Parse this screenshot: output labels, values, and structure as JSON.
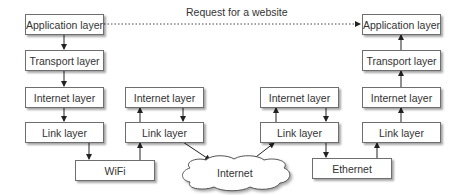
{
  "diagram": {
    "request_label": "Request for a website",
    "left_host": {
      "application": "Application layer",
      "transport": "Transport layer",
      "internet": "Internet layer",
      "link": "Link layer"
    },
    "wifi": "WiFi",
    "router_1": {
      "internet": "Internet layer",
      "link": "Link layer"
    },
    "cloud": "Internet",
    "router_2": {
      "internet": "Internet layer",
      "link": "Link layer"
    },
    "ethernet": "Ethernet",
    "right_host": {
      "application": "Application layer",
      "transport": "Transport layer",
      "internet": "Internet layer",
      "link": "Link layer"
    },
    "colors": {
      "stroke": "#333333",
      "box_border": "#6e6e6e",
      "text": "#333333"
    }
  }
}
